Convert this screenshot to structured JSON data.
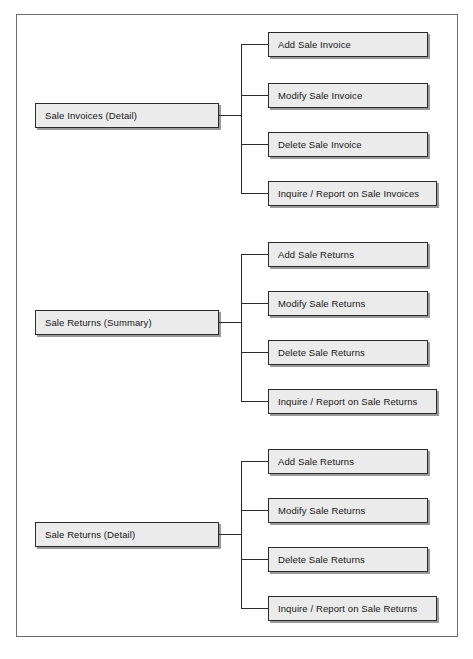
{
  "diagram": {
    "type": "functional-decomposition-tree",
    "orientation": "left-to-right",
    "groups": [
      {
        "id": "sale-invoices-detail",
        "parent": {
          "label": "Sale Invoices (Detail)"
        },
        "children": [
          {
            "label": "Add Sale Invoice"
          },
          {
            "label": "Modify Sale Invoice"
          },
          {
            "label": "Delete Sale Invoice"
          },
          {
            "label": "Inquire / Report on Sale Invoices"
          }
        ]
      },
      {
        "id": "sale-returns-summary",
        "parent": {
          "label": "Sale Returns (Summary)"
        },
        "children": [
          {
            "label": "Add Sale Returns"
          },
          {
            "label": "Modify Sale Returns"
          },
          {
            "label": "Delete Sale Returns"
          },
          {
            "label": "Inquire / Report on Sale Returns"
          }
        ]
      },
      {
        "id": "sale-returns-detail",
        "parent": {
          "label": "Sale Returns (Detail)"
        },
        "children": [
          {
            "label": "Add Sale Returns"
          },
          {
            "label": "Modify Sale Returns"
          },
          {
            "label": "Delete Sale Returns"
          },
          {
            "label": "Inquire / Report on Sale Returns"
          }
        ]
      }
    ],
    "colors": {
      "box_fill": "#ebebeb",
      "box_border": "#2b2b2b",
      "box_shadow": "#9a9a9a",
      "connector": "#2b2b2b",
      "frame_border": "#6d6d6d",
      "page_background": "#ffffff",
      "text": "#161616"
    }
  }
}
